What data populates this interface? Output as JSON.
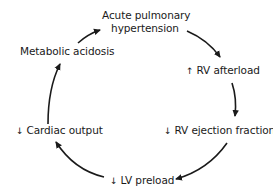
{
  "diagram": {
    "type": "cycle",
    "nodes": [
      {
        "id": "acute-pulmonary-hypertension",
        "line1": "Acute pulmonary",
        "line2": "hypertension",
        "symbol": ""
      },
      {
        "id": "rv-afterload",
        "label": "RV afterload",
        "symbol": "↑"
      },
      {
        "id": "rv-ejection-fraction",
        "label": "RV ejection fraction",
        "symbol": "↓"
      },
      {
        "id": "lv-preload",
        "label": "LV preload",
        "symbol": "↓"
      },
      {
        "id": "cardiac-output",
        "label": "Cardiac output",
        "symbol": "↓"
      },
      {
        "id": "metabolic-acidosis",
        "label": "Metabolic acidosis",
        "symbol": ""
      }
    ],
    "edges": [
      {
        "from": "acute-pulmonary-hypertension",
        "to": "rv-afterload"
      },
      {
        "from": "rv-afterload",
        "to": "rv-ejection-fraction"
      },
      {
        "from": "rv-ejection-fraction",
        "to": "lv-preload"
      },
      {
        "from": "lv-preload",
        "to": "cardiac-output"
      },
      {
        "from": "cardiac-output",
        "to": "metabolic-acidosis"
      },
      {
        "from": "metabolic-acidosis",
        "to": "acute-pulmonary-hypertension"
      }
    ],
    "colors": {
      "text": "#1a1a1a",
      "arrow": "#1a1a1a",
      "background": "#ffffff"
    }
  }
}
